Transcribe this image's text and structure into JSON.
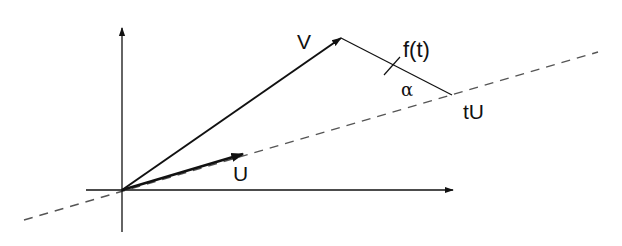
{
  "diagram": {
    "type": "vector-projection",
    "colors": {
      "background": "#ffffff",
      "stroke": "#111111",
      "dashed": "#555555"
    },
    "labels": {
      "v": "V",
      "u": "U",
      "tu": "tU",
      "f": "f(t)",
      "alpha": "α"
    },
    "elements": {
      "x_axis": {
        "from": [
          86,
          190
        ],
        "to": [
          453,
          190
        ]
      },
      "y_axis": {
        "from": [
          122,
          232
        ],
        "to": [
          122,
          28
        ]
      },
      "line_through_u": {
        "from": [
          24,
          220
        ],
        "to": [
          598,
          52
        ],
        "style": "dashed"
      },
      "vector_v": {
        "from": [
          122,
          190
        ],
        "to": [
          341,
          38
        ]
      },
      "vector_u": {
        "from": [
          122,
          190
        ],
        "to": [
          243,
          154
        ]
      },
      "segment_f": {
        "from": [
          341,
          38
        ],
        "to": [
          452,
          95
        ]
      },
      "tick_mark_on_f": {
        "at": [
          392,
          66
        ]
      }
    }
  }
}
